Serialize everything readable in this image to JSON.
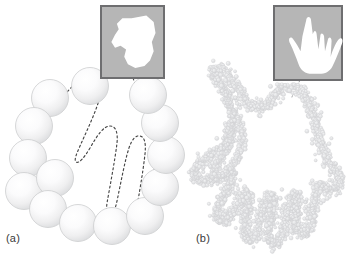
{
  "figure": {
    "kind": "scientific-illustration",
    "background_color": "#ffffff"
  },
  "panels": [
    {
      "id": "a",
      "label": "(a)",
      "label_x": 6,
      "label_y": 232,
      "sampling": "coarse",
      "element_kind": "sphere",
      "element_count": 14,
      "element_fill_light": "#ffffff",
      "element_fill_mid": "#ececed",
      "element_edge": "#c9cacb",
      "outline_kind": "dashed-hand-contour",
      "outline_color": "#4a4a4a",
      "outline_dash": "2 2.6",
      "outline_width": 1.15,
      "spheres": [
        {
          "cx": 50,
          "cy": 98,
          "r": 18.5
        },
        {
          "cx": 34,
          "cy": 126,
          "r": 18.5
        },
        {
          "cx": 28,
          "cy": 158,
          "r": 18.5
        },
        {
          "cx": 24,
          "cy": 191,
          "r": 18.5
        },
        {
          "cx": 55,
          "cy": 178,
          "r": 18.5
        },
        {
          "cx": 48,
          "cy": 209,
          "r": 18.5
        },
        {
          "cx": 78,
          "cy": 223,
          "r": 18.5
        },
        {
          "cx": 112,
          "cy": 226,
          "r": 18.5
        },
        {
          "cx": 145,
          "cy": 216,
          "r": 18.5
        },
        {
          "cx": 160,
          "cy": 187,
          "r": 18.5
        },
        {
          "cx": 166,
          "cy": 155,
          "r": 18.5
        },
        {
          "cx": 160,
          "cy": 123,
          "r": 18.5
        },
        {
          "cx": 148,
          "cy": 95,
          "r": 18.5
        },
        {
          "cx": 90,
          "cy": 86,
          "r": 18.5
        }
      ],
      "inset": {
        "x": 101,
        "y": 6,
        "width": 63,
        "height": 72,
        "border_color": "#6e6e70",
        "border_width": 2,
        "fill_color": "#b6b6b6",
        "shape_color": "#ffffff",
        "shape_kind": "blocky-low-resolution-hand",
        "leader_from_x": 133,
        "leader_from_y": 78,
        "leader_to_x": 141,
        "leader_to_y": 96
      }
    },
    {
      "id": "b",
      "label": "(b)",
      "label_x": 196,
      "label_y": 232,
      "sampling": "fine",
      "element_kind": "particle",
      "element_count": 2400,
      "element_fill": "#e2e3e4",
      "element_edge": "#cdced0",
      "element_radius": 1.5,
      "outline_kind": "dense-particle-hand-silhouette",
      "inset": {
        "x": 274,
        "y": 6,
        "width": 68,
        "height": 74,
        "border_color": "#6e6e70",
        "border_width": 2,
        "fill_color": "#b6b6b6",
        "shape_color": "#ffffff",
        "shape_kind": "detailed-five-finger-hand",
        "leader_from_x": 300,
        "leader_from_y": 80,
        "leader_to_x": 292,
        "leader_to_y": 96
      }
    }
  ]
}
